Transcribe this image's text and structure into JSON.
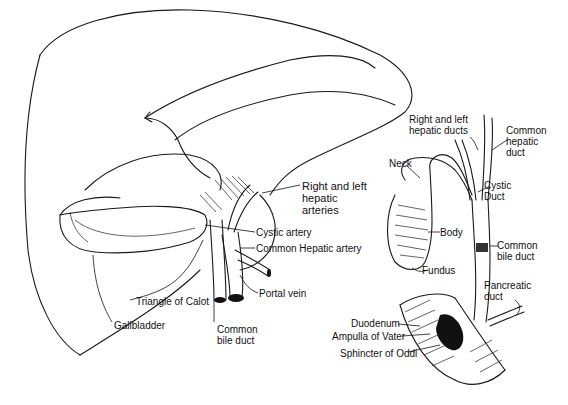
{
  "figure": {
    "left_panel": {
      "labels": {
        "right_left_hepatic_arteries": "Right and left\nhepatic\narteries",
        "cystic_artery": "Cystic artery",
        "common_hepatic_artery": "Common Hepatic artery",
        "portal_vein": "Portal vein",
        "triangle_of_calot": "Triangle of Calot",
        "gallbladder": "Gallbladder",
        "common_bile_duct": "Common\nbile duct"
      }
    },
    "right_panel": {
      "labels": {
        "right_left_hepatic_ducts": "Right and left\nhepatic ducts",
        "common_hepatic_duct": "Common\nhepatic\nduct",
        "neck": "Neck",
        "cystic_duct": "Cystic\nDuct",
        "body": "Body",
        "common_bile_duct": "Common\nbile duct",
        "fundus": "Fundus",
        "pancreatic_duct": "Pancreatic\nduct",
        "duodenum": "Duodenum",
        "ampulla_of_vater": "Ampulla of Vater",
        "sphincter_of_oddi": "Sphincter of Oddi"
      }
    }
  }
}
